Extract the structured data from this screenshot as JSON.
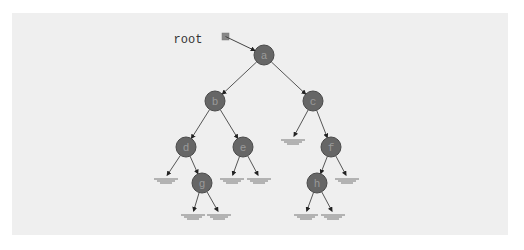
{
  "diagram": {
    "type": "binary-tree",
    "pointer": {
      "label": "root",
      "x": 188,
      "y": 39,
      "box": {
        "x": 222,
        "y": 33,
        "size": 7
      },
      "target": "a"
    },
    "node_radius": 10,
    "colors": {
      "panel": "#efefef",
      "node_fill": "#666666",
      "node_stroke": "#4a4a4a",
      "node_text": "#9a9a9a",
      "edge": "#555555",
      "pointer_box": "#888888",
      "null_line": "#777777"
    },
    "nodes": [
      {
        "id": "a",
        "label": "a",
        "x": 264,
        "y": 55
      },
      {
        "id": "b",
        "label": "b",
        "x": 215,
        "y": 101
      },
      {
        "id": "c",
        "label": "c",
        "x": 313,
        "y": 101
      },
      {
        "id": "d",
        "label": "d",
        "x": 186,
        "y": 147
      },
      {
        "id": "e",
        "label": "e",
        "x": 243,
        "y": 147
      },
      {
        "id": "f",
        "label": "f",
        "x": 331,
        "y": 147
      },
      {
        "id": "g",
        "label": "g",
        "x": 202,
        "y": 183
      },
      {
        "id": "h",
        "label": "h",
        "x": 317,
        "y": 183
      }
    ],
    "edges": [
      {
        "from": "a",
        "to": "b"
      },
      {
        "from": "a",
        "to": "c"
      },
      {
        "from": "b",
        "to": "d"
      },
      {
        "from": "b",
        "to": "e"
      },
      {
        "from": "c",
        "to": "null:c.left"
      },
      {
        "from": "c",
        "to": "f"
      },
      {
        "from": "d",
        "to": "null:d.left"
      },
      {
        "from": "d",
        "to": "g"
      },
      {
        "from": "e",
        "to": "null:e.left"
      },
      {
        "from": "e",
        "to": "null:e.right"
      },
      {
        "from": "f",
        "to": "h"
      },
      {
        "from": "f",
        "to": "null:f.right"
      },
      {
        "from": "g",
        "to": "null:g.left"
      },
      {
        "from": "g",
        "to": "null:g.right"
      },
      {
        "from": "h",
        "to": "null:h.left"
      },
      {
        "from": "h",
        "to": "null:h.right"
      }
    ],
    "nulls": [
      {
        "id": "null:c.left",
        "x": 293,
        "y": 138
      },
      {
        "id": "null:d.left",
        "x": 166,
        "y": 177
      },
      {
        "id": "null:e.left",
        "x": 232,
        "y": 177
      },
      {
        "id": "null:e.right",
        "x": 259,
        "y": 177
      },
      {
        "id": "null:f.right",
        "x": 347,
        "y": 177
      },
      {
        "id": "null:g.left",
        "x": 193,
        "y": 213
      },
      {
        "id": "null:g.right",
        "x": 219,
        "y": 213
      },
      {
        "id": "null:h.left",
        "x": 306,
        "y": 213
      },
      {
        "id": "null:h.right",
        "x": 333,
        "y": 213
      }
    ]
  }
}
